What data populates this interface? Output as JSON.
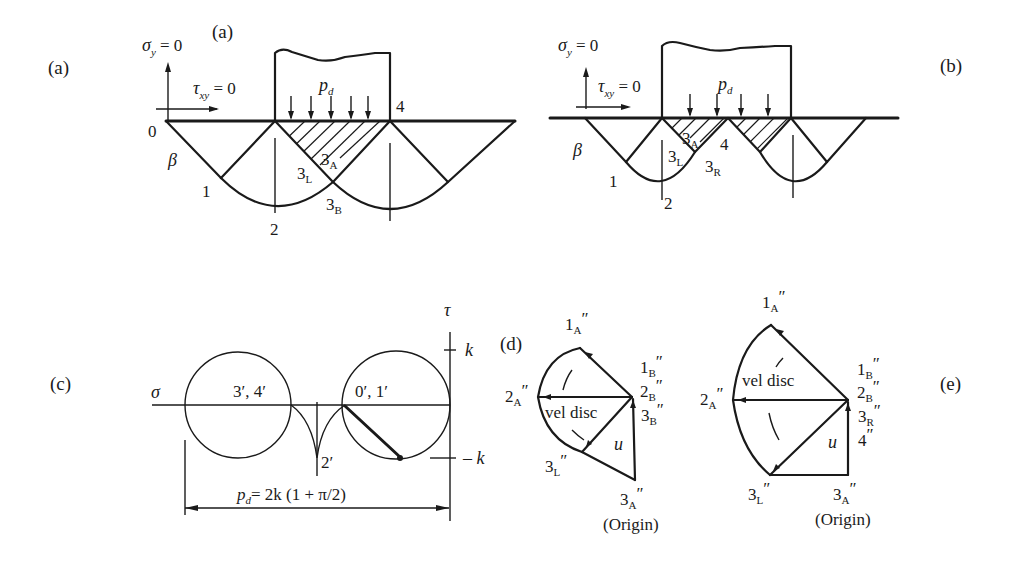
{
  "panels": {
    "a": {
      "label": "(a)",
      "inner_label": "(a)",
      "sigma_y": "σ",
      "sigma_y_sub": "y",
      "sigma_y_eq": " = 0",
      "tau": "τ",
      "tau_sub": "xy",
      "tau_eq": " = 0",
      "load": "p",
      "load_sub": "d",
      "beta": "β",
      "points": {
        "p0": "0",
        "p1": "1",
        "p2": "2",
        "p4": "4",
        "p3A": "3",
        "p3A_sub": "A",
        "p3L": "3",
        "p3L_sub": "L",
        "p3B": "3",
        "p3B_sub": "B"
      }
    },
    "b": {
      "label": "(b)",
      "sigma_y": "σ",
      "sigma_y_sub": "y",
      "sigma_y_eq": " = 0",
      "tau": "τ",
      "tau_sub": "xy",
      "tau_eq": " = 0",
      "load": "p",
      "load_sub": "d",
      "beta": "β",
      "points": {
        "p1": "1",
        "p2": "2",
        "p4": "4",
        "p3A": "3",
        "p3A_sub": "A",
        "p3L": "3",
        "p3L_sub": "L",
        "p3R": "3",
        "p3R_sub": "R"
      }
    },
    "c": {
      "label": "(c)",
      "sigma_axis": "σ",
      "tau_axis": "τ",
      "k_pos": "k",
      "k_neg": "– k",
      "left_circle": "3′, 4′",
      "right_circle": "0′, 1′",
      "cusp": "2′",
      "formula": "= 2k (1 + π/2)",
      "formula_p": "p",
      "formula_sub": "d"
    },
    "d": {
      "label": "(d)",
      "p1A": "1",
      "p1A_sub": "A",
      "p1B": "1",
      "p1B_sub": "B",
      "p2A": "2",
      "p2A_sub": "A",
      "p2B": "2",
      "p2B_sub": "B",
      "p3B": "3",
      "p3B_sub": "B",
      "p3L": "3",
      "p3L_sub": "L",
      "p3A": "3",
      "p3A_sub": "A",
      "prime": "″",
      "vel_disc": "vel disc",
      "u": "u",
      "origin": "(Origin)"
    },
    "e": {
      "label": "(e)",
      "p1A": "1",
      "p1A_sub": "A",
      "p1B": "1",
      "p1B_sub": "B",
      "p2A": "2",
      "p2A_sub": "A",
      "p2B": "2",
      "p2B_sub": "B",
      "p3R": "3",
      "p3R_sub": "R",
      "p4": "4",
      "p3L": "3",
      "p3L_sub": "L",
      "p3A": "3",
      "p3A_sub": "A",
      "prime": "″",
      "vel_disc": "vel disc",
      "u": "u",
      "origin": "(Origin)"
    }
  }
}
